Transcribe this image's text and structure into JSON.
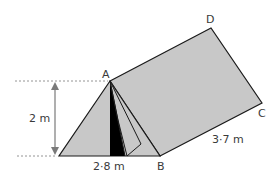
{
  "diagram": {
    "type": "tent-prism",
    "points": {
      "A": "A",
      "B": "B",
      "C": "C",
      "D": "D"
    },
    "dimensions": {
      "height": "2 m",
      "base": "2·8 m",
      "length": "3·7 m"
    },
    "colors": {
      "fill": "#c8c8c8",
      "stroke": "#1a1a1a",
      "door": "#000000",
      "guide": "#7a7a7a"
    }
  }
}
